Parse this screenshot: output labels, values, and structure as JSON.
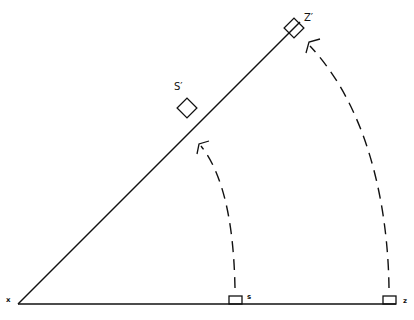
{
  "diagram": {
    "type": "geometric-rotation",
    "stroke_color": "#111111",
    "background": "#ffffff",
    "labels": {
      "vertex": "x",
      "point_s": "s",
      "point_z": "z",
      "point_s_prime": "S′",
      "point_z_prime": "Z′"
    },
    "elements": [
      {
        "name": "baseline",
        "from": [
          18,
          304
        ],
        "to": [
          396,
          304
        ]
      },
      {
        "name": "rotated-line",
        "from": [
          18,
          304
        ],
        "to": [
          300,
          22
        ]
      },
      {
        "name": "box-s",
        "center": [
          235,
          300
        ]
      },
      {
        "name": "box-z",
        "center": [
          389,
          300
        ]
      },
      {
        "name": "box-s-prime",
        "center": [
          187,
          108
        ],
        "rotation_deg": 45
      },
      {
        "name": "box-z-prime",
        "center": [
          294,
          28
        ],
        "rotation_deg": 45
      },
      {
        "name": "arc-s-to-s-prime",
        "style": "dashed",
        "arrow": "end"
      },
      {
        "name": "arc-z-to-z-prime",
        "style": "dashed",
        "arrow": "end"
      }
    ]
  }
}
